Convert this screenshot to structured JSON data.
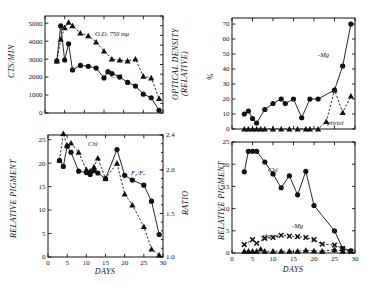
{
  "figure": {
    "title": "",
    "background": "#ffffff",
    "ink": "#111111"
  },
  "panels": {
    "top_left": {
      "name": "radioactivity-and-optical-density-vs-days",
      "ylabel_left": "CTS/MIN",
      "ylabel_right_line1": "OPTICAL DENSITY",
      "ylabel_right_line2": "(RELATIVE)",
      "xlabel": "",
      "yticks_left": [
        "0",
        "1000",
        "2000",
        "3000",
        "4000",
        "5000"
      ],
      "series_labels": {
        "od": "O.D. 750 mμ",
        "c14": "C14"
      }
    },
    "bottom_left": {
      "name": "relative-pigment-and-ratio-vs-days",
      "ylabel_left": "RELATIVE PIGMENT",
      "ylabel_right": "RATIO",
      "xlabel": "DAYS",
      "yticks_left": [
        "0",
        "5",
        "10",
        "15",
        "20",
        "25"
      ],
      "yticks_right": [
        "1.0",
        "1.5",
        "2.0",
        "2.4"
      ],
      "xticks": [
        "0",
        "5",
        "10",
        "15",
        "20",
        "25",
        "30"
      ],
      "series_labels": {
        "chl": "Chl",
        "ratio": "F₀/Fₐ"
      }
    },
    "top_right": {
      "name": "percent-derivatives-vs-days",
      "ylabel": "%",
      "xlabel": "",
      "yticks": [
        "0",
        "10",
        "20",
        "30",
        "40",
        "50",
        "60",
        "70"
      ],
      "series_labels": {
        "mg": "-Mg",
        "phytol": "-phytol"
      }
    },
    "bottom_right": {
      "name": "relative-pigment-derivatives-vs-days",
      "ylabel": "RELATIVE PIGMENT",
      "xlabel": "DAYS",
      "yticks": [
        "0",
        "5",
        "10",
        "15",
        "20",
        "25"
      ],
      "xticks": [
        "0",
        "5",
        "10",
        "15",
        "20",
        "25",
        "30"
      ],
      "series_labels": {
        "chl": "Chl",
        "mg": "-Mg",
        "phytol": "-phytol"
      }
    }
  },
  "chart_data": [
    {
      "id": "top-left",
      "type": "line",
      "title": "",
      "xlabel": "DAYS",
      "ylabel": "CTS/MIN",
      "ylabel_secondary": "OPTICAL DENSITY (RELATIVE)",
      "xlim": [
        0,
        30
      ],
      "ylim": [
        0,
        5400
      ],
      "ylim_secondary": [
        0,
        5400
      ],
      "grid": false,
      "legend": "inline-annotation",
      "series": [
        {
          "name": "O.D. 750 mμ",
          "marker": "triangle",
          "line": "dashed",
          "axis": "right",
          "x": [
            3,
            4,
            5,
            6,
            7,
            9,
            11,
            13,
            15,
            17,
            19,
            21,
            23,
            25,
            27,
            29
          ],
          "y": [
            2900,
            4100,
            4750,
            5050,
            4850,
            4450,
            4300,
            3950,
            3450,
            3000,
            2950,
            2900,
            3000,
            2050,
            1950,
            800
          ]
        },
        {
          "name": "C14",
          "marker": "circle",
          "line": "solid",
          "axis": "left",
          "x": [
            3,
            4,
            5,
            6,
            7,
            9,
            11,
            13,
            15,
            16,
            17,
            19,
            21,
            23,
            25,
            27,
            29
          ],
          "y": [
            2900,
            4850,
            2950,
            3850,
            2400,
            2650,
            2600,
            2500,
            1950,
            2300,
            2200,
            2000,
            1700,
            1500,
            1050,
            850,
            150
          ]
        }
      ]
    },
    {
      "id": "bottom-left",
      "type": "line",
      "title": "",
      "xlabel": "DAYS",
      "ylabel": "RELATIVE PIGMENT",
      "ylabel_secondary": "RATIO",
      "xlim": [
        0,
        30
      ],
      "ylim": [
        0,
        26
      ],
      "ylim_secondary": [
        1.0,
        2.4
      ],
      "grid": false,
      "legend": "inline-annotation",
      "series": [
        {
          "name": "Chl",
          "marker": "triangle",
          "line": "dashed",
          "axis": "left",
          "x": [
            3,
            4,
            5,
            6,
            8,
            10,
            11,
            12,
            13,
            15,
            18,
            20,
            22,
            25,
            27,
            29
          ],
          "y": [
            20.6,
            26.3,
            23.8,
            24.3,
            22.3,
            18.6,
            18.3,
            19.2,
            21.1,
            16.7,
            20.0,
            13.4,
            11.1,
            6.5,
            1.7,
            0.4
          ]
        },
        {
          "name": "F₀/Fₐ",
          "marker": "circle",
          "line": "solid",
          "axis": "right",
          "x": [
            3,
            4,
            5,
            6,
            8,
            10,
            11,
            12,
            13,
            15,
            18,
            20,
            22,
            25,
            27,
            29
          ],
          "y": [
            20.6,
            19.3,
            23.6,
            22.3,
            18.3,
            18.0,
            17.6,
            18.4,
            17.9,
            16.7,
            22.9,
            17.4,
            16.4,
            15.3,
            11.9,
            4.8
          ]
        }
      ]
    },
    {
      "id": "top-right",
      "type": "line",
      "title": "",
      "xlabel": "DAYS",
      "ylabel": "%",
      "xlim": [
        0,
        30
      ],
      "ylim": [
        0,
        74
      ],
      "grid": false,
      "legend": "inline-annotation",
      "series": [
        {
          "name": "-Mg",
          "marker": "circle",
          "line": "solid",
          "x": [
            3,
            4,
            5,
            6,
            8,
            10,
            12,
            13,
            15,
            17,
            19,
            21,
            25,
            27,
            29
          ],
          "y": [
            10,
            12,
            7,
            4,
            13,
            17,
            20,
            17,
            20,
            7.5,
            20,
            20,
            26,
            42,
            70
          ]
        },
        {
          "name": "-phytol",
          "marker": "triangle",
          "line": "dashed",
          "x": [
            3,
            4,
            5,
            6,
            7,
            8,
            10,
            12,
            14,
            16,
            18,
            19,
            21,
            23,
            25,
            27,
            29
          ],
          "y": [
            0,
            0,
            0,
            0,
            0,
            0,
            0,
            0,
            0,
            0,
            0,
            0,
            0,
            5,
            26,
            11,
            22
          ]
        }
      ]
    },
    {
      "id": "bottom-right",
      "type": "line",
      "title": "",
      "xlabel": "DAYS",
      "ylabel": "RELATIVE PIGMENT",
      "xlim": [
        0,
        30
      ],
      "ylim": [
        0,
        25
      ],
      "grid": false,
      "legend": "inline-annotation",
      "series": [
        {
          "name": "Chl",
          "marker": "circle",
          "line": "solid",
          "x": [
            3,
            4,
            5,
            6,
            8,
            10,
            12,
            14,
            16,
            18,
            20,
            25,
            27,
            29
          ],
          "y": [
            18.3,
            22.9,
            22.9,
            22.9,
            20.5,
            17.8,
            14.7,
            17.4,
            13.1,
            18.4,
            10.7,
            5.0,
            1.0,
            0.5
          ]
        },
        {
          "name": "-Mg",
          "marker": "x",
          "line": "dashed",
          "x": [
            3,
            5,
            6,
            8,
            10,
            12,
            14,
            16,
            18,
            20,
            22,
            25,
            27,
            29
          ],
          "y": [
            1.9,
            3.0,
            2.2,
            3.3,
            3.5,
            4.0,
            3.8,
            3.7,
            3.5,
            3.0,
            2.0,
            1.8,
            1.0,
            0.4
          ]
        },
        {
          "name": "-phytol",
          "marker": "triangle",
          "line": "dashed",
          "x": [
            3,
            4,
            5,
            6,
            7,
            8,
            10,
            12,
            14,
            16,
            18,
            20,
            22,
            25,
            27,
            29
          ],
          "y": [
            0.4,
            0.4,
            0.4,
            0.4,
            0.9,
            0.4,
            0.4,
            0.4,
            0.4,
            0.4,
            0.6,
            0.5,
            0.4,
            0.8,
            0.4,
            0.4
          ]
        }
      ]
    }
  ]
}
